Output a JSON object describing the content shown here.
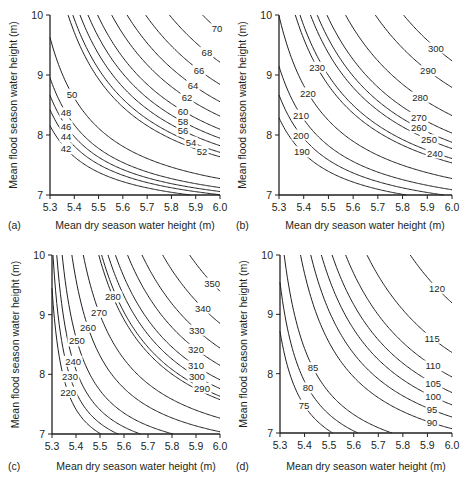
{
  "chart_data": [
    {
      "panel": "(a)",
      "type": "contour",
      "xlabel": "Mean dry season water height (m)",
      "ylabel": "Mean flood season water height (m)",
      "xlim": [
        5.3,
        6.0
      ],
      "ylim": [
        7,
        10
      ],
      "xticks": [
        "5.3",
        "5.4",
        "5.5",
        "5.6",
        "5.7",
        "5.8",
        "5.9",
        "6.0"
      ],
      "yticks": [
        "7",
        "8",
        "9",
        "10"
      ],
      "grid": false,
      "levels": [
        {
          "level": "42",
          "label_at": [
            5.366,
            7.77
          ]
        },
        {
          "level": "44",
          "label_at": [
            5.366,
            7.97
          ]
        },
        {
          "level": "46",
          "label_at": [
            5.366,
            8.15
          ]
        },
        {
          "level": "48",
          "label_at": [
            5.366,
            8.37
          ]
        },
        {
          "level": "50",
          "label_at": [
            5.391,
            8.68
          ]
        },
        {
          "level": "52",
          "label_at": [
            5.926,
            7.73
          ]
        },
        {
          "level": "54",
          "label_at": [
            5.881,
            7.88
          ]
        },
        {
          "level": "56",
          "label_at": [
            5.848,
            8.07
          ]
        },
        {
          "level": "58",
          "label_at": [
            5.848,
            8.22
          ]
        },
        {
          "level": "60",
          "label_at": [
            5.848,
            8.4
          ]
        },
        {
          "level": "62",
          "label_at": [
            5.864,
            8.62
          ]
        },
        {
          "level": "64",
          "label_at": [
            5.889,
            8.83
          ]
        },
        {
          "level": "66",
          "label_at": [
            5.914,
            9.08
          ]
        },
        {
          "level": "68",
          "label_at": [
            5.946,
            9.38
          ]
        },
        {
          "level": "70",
          "label_at": [
            5.988,
            9.77
          ]
        }
      ]
    },
    {
      "panel": "(b)",
      "type": "contour",
      "xlabel": "Mean dry season water height (m)",
      "ylabel": "Mean flood season water height (m)",
      "xlim": [
        5.3,
        6.0
      ],
      "ylim": [
        7,
        10
      ],
      "xticks": [
        "5.3",
        "5.4",
        "5.5",
        "5.6",
        "5.7",
        "5.8",
        "5.9",
        "6.0"
      ],
      "yticks": [
        "7",
        "8",
        "9",
        "10"
      ],
      "grid": false,
      "levels": [
        {
          "level": "190",
          "label_at": [
            5.393,
            7.72
          ]
        },
        {
          "level": "200",
          "label_at": [
            5.389,
            8.0
          ]
        },
        {
          "level": "210",
          "label_at": [
            5.389,
            8.33
          ]
        },
        {
          "level": "220",
          "label_at": [
            5.417,
            8.7
          ]
        },
        {
          "level": "230",
          "label_at": [
            5.454,
            9.13
          ]
        },
        {
          "level": "240",
          "label_at": [
            5.931,
            7.7
          ]
        },
        {
          "level": "250",
          "label_at": [
            5.907,
            7.92
          ]
        },
        {
          "level": "260",
          "label_at": [
            5.866,
            8.12
          ]
        },
        {
          "level": "270",
          "label_at": [
            5.866,
            8.3
          ]
        },
        {
          "level": "280",
          "label_at": [
            5.871,
            8.63
          ]
        },
        {
          "level": "290",
          "label_at": [
            5.903,
            9.07
          ]
        },
        {
          "level": "300",
          "label_at": [
            5.935,
            9.45
          ]
        }
      ]
    },
    {
      "panel": "(c)",
      "type": "contour",
      "xlabel": "Mean dry season water height (m)",
      "ylabel": "Mean flood season water height (m)",
      "xlim": [
        5.3,
        6.0
      ],
      "ylim": [
        7,
        10
      ],
      "xticks": [
        "5.3",
        "5.4",
        "5.5",
        "5.6",
        "5.7",
        "5.8",
        "5.9",
        "6.0"
      ],
      "yticks": [
        "7",
        "8",
        "9",
        "10"
      ],
      "grid": false,
      "levels": [
        {
          "level": "220",
          "label_at": [
            5.367,
            7.7
          ]
        },
        {
          "level": "230",
          "label_at": [
            5.375,
            7.96
          ]
        },
        {
          "level": "240",
          "label_at": [
            5.388,
            8.22
          ]
        },
        {
          "level": "250",
          "label_at": [
            5.404,
            8.56
          ]
        },
        {
          "level": "260",
          "label_at": [
            5.45,
            8.79
          ]
        },
        {
          "level": "270",
          "label_at": [
            5.496,
            9.04
          ]
        },
        {
          "level": "280",
          "label_at": [
            5.554,
            9.3
          ]
        },
        {
          "level": "290",
          "label_at": [
            5.925,
            7.77
          ]
        },
        {
          "level": "300",
          "label_at": [
            5.904,
            7.96
          ]
        },
        {
          "level": "310",
          "label_at": [
            5.9,
            8.14
          ]
        },
        {
          "level": "320",
          "label_at": [
            5.9,
            8.42
          ]
        },
        {
          "level": "330",
          "label_at": [
            5.904,
            8.74
          ]
        },
        {
          "level": "340",
          "label_at": [
            5.929,
            9.11
          ]
        },
        {
          "level": "350",
          "label_at": [
            5.967,
            9.53
          ]
        }
      ]
    },
    {
      "panel": "(d)",
      "type": "contour",
      "xlabel": "Mean dry season water height (m)",
      "ylabel": "Mean flood season water height (m)",
      "xlim": [
        5.3,
        6.0
      ],
      "ylim": [
        7,
        10
      ],
      "xticks": [
        "5.3",
        "5.4",
        "5.5",
        "5.6",
        "5.7",
        "5.8",
        "5.9",
        "6.0"
      ],
      "yticks": [
        "7",
        "8",
        "9",
        "10"
      ],
      "grid": false,
      "levels": [
        {
          "level": "75",
          "label_at": [
            5.398,
            7.47
          ]
        },
        {
          "level": "80",
          "label_at": [
            5.414,
            7.76
          ]
        },
        {
          "level": "85",
          "label_at": [
            5.434,
            8.1
          ]
        },
        {
          "level": "90",
          "label_at": [
            5.919,
            7.17
          ]
        },
        {
          "level": "95",
          "label_at": [
            5.919,
            7.39
          ]
        },
        {
          "level": "100",
          "label_at": [
            5.923,
            7.61
          ]
        },
        {
          "level": "105",
          "label_at": [
            5.923,
            7.84
          ]
        },
        {
          "level": "110",
          "label_at": [
            5.923,
            8.13
          ]
        },
        {
          "level": "115",
          "label_at": [
            5.919,
            8.6
          ]
        },
        {
          "level": "120",
          "label_at": [
            5.939,
            9.44
          ]
        }
      ]
    }
  ]
}
